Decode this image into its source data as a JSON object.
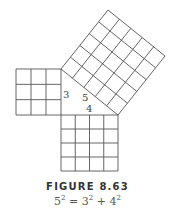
{
  "figure": {
    "label": "FIGURE 8.63",
    "formula": {
      "c": "5",
      "a": "3",
      "b": "4",
      "exp": "2",
      "eq": " = ",
      "plus": " + "
    }
  },
  "diagram": {
    "side_labels": {
      "a": "3",
      "b": "4",
      "c": "5"
    },
    "squares": [
      {
        "name": "square-a",
        "units": 3
      },
      {
        "name": "square-b",
        "units": 4
      },
      {
        "name": "square-c",
        "units": 5
      }
    ],
    "line_color": "#555555"
  }
}
